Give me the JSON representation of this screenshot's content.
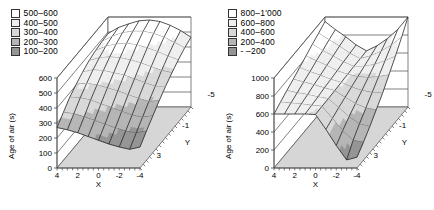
{
  "chart_data": [
    {
      "type": "surface3d",
      "panel": "left",
      "xlabel": "X",
      "ylabel": "Y",
      "zlabel": "Age of air (s)",
      "x_ticks": [
        "4",
        "2",
        "0",
        "-2",
        "-4"
      ],
      "y_ticks": [
        "3",
        "-1",
        "-5"
      ],
      "z_ticks": [
        0,
        100,
        200,
        300,
        400,
        500,
        600
      ],
      "zlim": [
        0,
        600
      ],
      "x_values": [
        4,
        3,
        2,
        1,
        0,
        -1,
        -2,
        -3,
        -4
      ],
      "y_values": [
        3,
        2,
        1,
        0,
        -1,
        -2,
        -3,
        -4,
        -5
      ],
      "legend_position": "top-left",
      "grid": true,
      "bands": [
        {
          "label": "500–600",
          "lo": 500,
          "color": "#ffffff"
        },
        {
          "label": "400–500",
          "lo": 400,
          "color": "#efefef"
        },
        {
          "label": "300–400",
          "lo": 300,
          "color": "#d8d8d8"
        },
        {
          "label": "200–300",
          "lo": 200,
          "color": "#b5b5b5"
        },
        {
          "label": "100–200",
          "lo": 100,
          "color": "#949494"
        }
      ],
      "z_grid": [
        [
          270,
          255,
          235,
          210,
          185,
          160,
          140,
          125,
          140
        ],
        [
          320,
          310,
          290,
          265,
          240,
          215,
          195,
          180,
          195
        ],
        [
          370,
          365,
          350,
          325,
          300,
          275,
          250,
          235,
          245
        ],
        [
          405,
          410,
          400,
          380,
          360,
          335,
          310,
          290,
          295
        ],
        [
          435,
          450,
          445,
          430,
          415,
          390,
          365,
          340,
          340
        ],
        [
          460,
          480,
          485,
          480,
          465,
          445,
          420,
          395,
          380
        ],
        [
          475,
          505,
          520,
          525,
          515,
          495,
          470,
          440,
          415
        ],
        [
          485,
          520,
          545,
          555,
          555,
          540,
          515,
          480,
          445
        ],
        [
          490,
          530,
          555,
          575,
          580,
          570,
          545,
          510,
          465
        ]
      ]
    },
    {
      "type": "surface3d",
      "panel": "right",
      "xlabel": "X",
      "ylabel": "Y",
      "zlabel": "Age of air (s)",
      "x_ticks": [
        "4",
        "2",
        "0",
        "-2",
        "-4"
      ],
      "y_ticks": [
        "3",
        "-1",
        "-5"
      ],
      "z_ticks": [
        0,
        200,
        400,
        600,
        800,
        1000
      ],
      "zlim": [
        0,
        1000
      ],
      "x_values": [
        4,
        3,
        2,
        1,
        0,
        -1,
        -2,
        -3,
        -4
      ],
      "y_values": [
        3,
        2,
        1,
        0,
        -1,
        -2,
        -3,
        -4,
        -5
      ],
      "legend_position": "top-left",
      "grid": true,
      "bands": [
        {
          "label": "800–1'000",
          "lo": 800,
          "color": "#ffffff"
        },
        {
          "label": "600–800",
          "lo": 600,
          "color": "#efefef"
        },
        {
          "label": "400–600",
          "lo": 400,
          "color": "#d8d8d8"
        },
        {
          "label": "200–400",
          "lo": 200,
          "color": "#b5b5b5"
        },
        {
          "label": "-  –200",
          "lo": null,
          "color": "#949494"
        }
      ],
      "z_grid": [
        [
          600,
          600,
          600,
          600,
          595,
          430,
          250,
          90,
          120
        ],
        [
          645,
          635,
          625,
          610,
          600,
          465,
          330,
          220,
          200
        ],
        [
          690,
          665,
          645,
          620,
          600,
          500,
          400,
          320,
          290
        ],
        [
          730,
          700,
          670,
          635,
          605,
          530,
          460,
          410,
          390
        ],
        [
          775,
          730,
          690,
          645,
          610,
          560,
          520,
          500,
          490
        ],
        [
          820,
          765,
          715,
          655,
          615,
          590,
          580,
          590,
          610
        ],
        [
          865,
          795,
          735,
          670,
          620,
          620,
          640,
          680,
          730
        ],
        [
          905,
          830,
          760,
          680,
          620,
          650,
          700,
          770,
          860
        ],
        [
          950,
          860,
          780,
          690,
          625,
          680,
          760,
          860,
          1000
        ]
      ]
    }
  ],
  "colors": {
    "floor": "#d6d6d6",
    "wall": "#ffffff",
    "frame_line": "#4a4a4a",
    "mesh_line": "#1c1c1c",
    "text": "#000000"
  }
}
